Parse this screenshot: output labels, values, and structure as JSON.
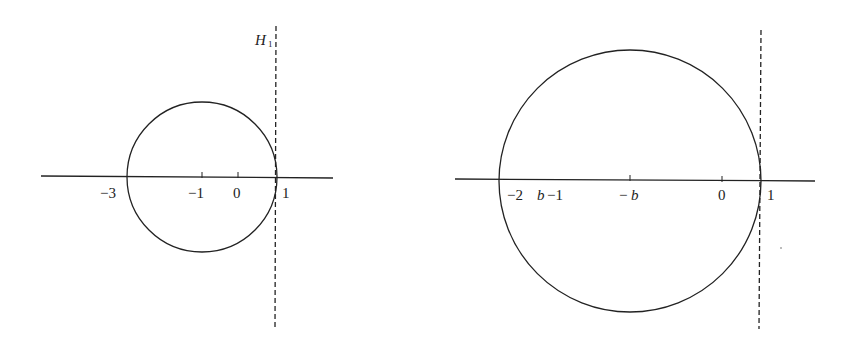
{
  "figure": {
    "panels": [
      {
        "id": "left",
        "hyperplane_label": "H",
        "hyperplane_subscript": "1",
        "tick_labels": {
          "left_intercept": "−3",
          "center": "−1",
          "origin": "0",
          "right_intercept": "1"
        }
      },
      {
        "id": "right",
        "tick_labels": {
          "left_intercept_a": "−2",
          "left_intercept_b": "b",
          "left_intercept_c": "−1",
          "center_minus": "−",
          "center_b": "b",
          "origin": "0",
          "right_intercept": "1"
        }
      }
    ],
    "colors": {
      "line": "#222222",
      "background": "#ffffff"
    }
  }
}
